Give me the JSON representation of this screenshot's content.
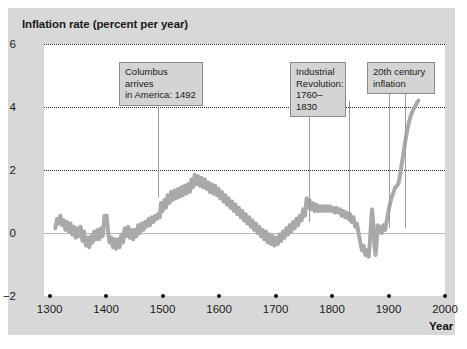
{
  "chart_data": {
    "type": "line",
    "title": "Inflation rate (percent per year)",
    "xlabel": "Year",
    "ylabel": "Inflation rate (percent per year)",
    "xlim": [
      1290,
      2000
    ],
    "ylim": [
      -2,
      6
    ],
    "xticks": [
      1300,
      1400,
      1500,
      1600,
      1700,
      1800,
      1900,
      2000
    ],
    "xtick_labels": [
      "1300",
      "1400",
      "1500",
      "1600",
      "1700",
      "1800",
      "1900",
      "2000"
    ],
    "yticks": [
      -2,
      0,
      2,
      4,
      6
    ],
    "ytick_labels": [
      "−2",
      "0",
      "2",
      "4",
      "6"
    ],
    "gridlines_y": [
      2,
      4,
      6
    ],
    "grid": "horizontal-dotted",
    "zero_line": 0,
    "legend": "none",
    "series": [
      {
        "name": "Inflation rate",
        "color": "#a9a9a9",
        "line_width": 4,
        "x_start": 1310,
        "x_end": 1955,
        "points": [
          [
            1310,
            0.15
          ],
          [
            1313,
            0.45
          ],
          [
            1316,
            0.3
          ],
          [
            1319,
            0.55
          ],
          [
            1322,
            0.25
          ],
          [
            1325,
            0.4
          ],
          [
            1328,
            0.1
          ],
          [
            1331,
            0.35
          ],
          [
            1334,
            0.05
          ],
          [
            1337,
            0.3
          ],
          [
            1340,
            -0.05
          ],
          [
            1343,
            0.2
          ],
          [
            1346,
            -0.15
          ],
          [
            1349,
            0.15
          ],
          [
            1352,
            -0.1
          ],
          [
            1355,
            0.2
          ],
          [
            1358,
            -0.25
          ],
          [
            1361,
            0.05
          ],
          [
            1364,
            -0.4
          ],
          [
            1367,
            -0.15
          ],
          [
            1370,
            -0.45
          ],
          [
            1373,
            -0.1
          ],
          [
            1376,
            -0.3
          ],
          [
            1379,
            0.05
          ],
          [
            1382,
            -0.2
          ],
          [
            1385,
            0.1
          ],
          [
            1388,
            -0.2
          ],
          [
            1391,
            0.15
          ],
          [
            1394,
            -0.1
          ],
          [
            1397,
            0.55
          ],
          [
            1399,
            0.3
          ],
          [
            1401,
            0.55
          ],
          [
            1403,
            0.1
          ],
          [
            1406,
            -0.3
          ],
          [
            1409,
            -0.15
          ],
          [
            1412,
            -0.45
          ],
          [
            1415,
            -0.2
          ],
          [
            1418,
            -0.5
          ],
          [
            1421,
            -0.2
          ],
          [
            1424,
            -0.45
          ],
          [
            1427,
            -0.05
          ],
          [
            1430,
            -0.3
          ],
          [
            1433,
            0.15
          ],
          [
            1436,
            -0.1
          ],
          [
            1439,
            0.2
          ],
          [
            1442,
            -0.15
          ],
          [
            1445,
            0.1
          ],
          [
            1448,
            -0.2
          ],
          [
            1451,
            0.1
          ],
          [
            1454,
            -0.1
          ],
          [
            1457,
            0.25
          ],
          [
            1460,
            0.0
          ],
          [
            1463,
            0.3
          ],
          [
            1466,
            0.1
          ],
          [
            1469,
            0.35
          ],
          [
            1472,
            0.2
          ],
          [
            1475,
            0.45
          ],
          [
            1478,
            0.25
          ],
          [
            1481,
            0.5
          ],
          [
            1484,
            0.35
          ],
          [
            1487,
            0.55
          ],
          [
            1490,
            0.45
          ],
          [
            1492,
            0.6
          ],
          [
            1495,
            0.5
          ],
          [
            1497,
            0.95
          ],
          [
            1500,
            0.7
          ],
          [
            1503,
            1.05
          ],
          [
            1506,
            0.8
          ],
          [
            1509,
            1.2
          ],
          [
            1512,
            0.95
          ],
          [
            1515,
            1.3
          ],
          [
            1518,
            1.05
          ],
          [
            1521,
            1.35
          ],
          [
            1524,
            1.1
          ],
          [
            1527,
            1.4
          ],
          [
            1530,
            1.15
          ],
          [
            1533,
            1.45
          ],
          [
            1536,
            1.2
          ],
          [
            1539,
            1.5
          ],
          [
            1542,
            1.25
          ],
          [
            1545,
            1.55
          ],
          [
            1548,
            1.3
          ],
          [
            1551,
            1.7
          ],
          [
            1554,
            1.45
          ],
          [
            1557,
            1.85
          ],
          [
            1560,
            1.55
          ],
          [
            1563,
            1.8
          ],
          [
            1566,
            1.5
          ],
          [
            1569,
            1.75
          ],
          [
            1572,
            1.45
          ],
          [
            1575,
            1.7
          ],
          [
            1578,
            1.4
          ],
          [
            1581,
            1.6
          ],
          [
            1584,
            1.3
          ],
          [
            1587,
            1.55
          ],
          [
            1590,
            1.25
          ],
          [
            1593,
            1.5
          ],
          [
            1596,
            1.2
          ],
          [
            1599,
            1.4
          ],
          [
            1602,
            1.1
          ],
          [
            1605,
            1.3
          ],
          [
            1608,
            1.0
          ],
          [
            1611,
            1.2
          ],
          [
            1614,
            0.9
          ],
          [
            1617,
            1.1
          ],
          [
            1620,
            0.8
          ],
          [
            1623,
            1.0
          ],
          [
            1626,
            0.7
          ],
          [
            1629,
            0.9
          ],
          [
            1632,
            0.6
          ],
          [
            1635,
            0.8
          ],
          [
            1638,
            0.5
          ],
          [
            1641,
            0.7
          ],
          [
            1644,
            0.4
          ],
          [
            1647,
            0.6
          ],
          [
            1650,
            0.3
          ],
          [
            1653,
            0.5
          ],
          [
            1656,
            0.2
          ],
          [
            1659,
            0.4
          ],
          [
            1662,
            0.1
          ],
          [
            1665,
            0.3
          ],
          [
            1668,
            0.0
          ],
          [
            1671,
            0.2
          ],
          [
            1674,
            -0.1
          ],
          [
            1677,
            0.1
          ],
          [
            1680,
            -0.2
          ],
          [
            1683,
            0.05
          ],
          [
            1686,
            -0.3
          ],
          [
            1689,
            -0.05
          ],
          [
            1692,
            -0.35
          ],
          [
            1695,
            -0.1
          ],
          [
            1698,
            -0.4
          ],
          [
            1701,
            -0.15
          ],
          [
            1704,
            -0.35
          ],
          [
            1707,
            -0.05
          ],
          [
            1710,
            -0.25
          ],
          [
            1713,
            0.05
          ],
          [
            1716,
            -0.15
          ],
          [
            1719,
            0.15
          ],
          [
            1722,
            -0.05
          ],
          [
            1725,
            0.25
          ],
          [
            1728,
            0.05
          ],
          [
            1731,
            0.35
          ],
          [
            1734,
            0.15
          ],
          [
            1737,
            0.45
          ],
          [
            1740,
            0.25
          ],
          [
            1743,
            0.55
          ],
          [
            1746,
            0.4
          ],
          [
            1749,
            0.75
          ],
          [
            1752,
            0.55
          ],
          [
            1755,
            1.1
          ],
          [
            1757,
            0.8
          ],
          [
            1760,
            1.05
          ],
          [
            1763,
            0.75
          ],
          [
            1766,
            0.95
          ],
          [
            1769,
            0.7
          ],
          [
            1772,
            0.9
          ],
          [
            1775,
            0.7
          ],
          [
            1778,
            0.85
          ],
          [
            1781,
            0.7
          ],
          [
            1784,
            0.85
          ],
          [
            1787,
            0.7
          ],
          [
            1790,
            0.85
          ],
          [
            1793,
            0.7
          ],
          [
            1796,
            0.85
          ],
          [
            1799,
            0.7
          ],
          [
            1802,
            0.8
          ],
          [
            1805,
            0.65
          ],
          [
            1808,
            0.8
          ],
          [
            1811,
            0.65
          ],
          [
            1814,
            0.75
          ],
          [
            1817,
            0.55
          ],
          [
            1820,
            0.7
          ],
          [
            1823,
            0.5
          ],
          [
            1826,
            0.65
          ],
          [
            1829,
            0.45
          ],
          [
            1832,
            0.6
          ],
          [
            1835,
            0.35
          ],
          [
            1838,
            0.5
          ],
          [
            1841,
            0.2
          ],
          [
            1844,
            0.3
          ],
          [
            1847,
            0.0
          ],
          [
            1850,
            -0.3
          ],
          [
            1853,
            -0.55
          ],
          [
            1856,
            -0.4
          ],
          [
            1859,
            -0.7
          ],
          [
            1862,
            -0.55
          ],
          [
            1865,
            -0.75
          ],
          [
            1867,
            -0.3
          ],
          [
            1869,
            0.3
          ],
          [
            1871,
            0.75
          ],
          [
            1873,
            0.3
          ],
          [
            1875,
            -0.35
          ],
          [
            1877,
            -0.7
          ],
          [
            1879,
            -0.3
          ],
          [
            1881,
            0.25
          ],
          [
            1883,
            0.05
          ],
          [
            1885,
            0.2
          ],
          [
            1888,
            0.0
          ],
          [
            1891,
            0.25
          ],
          [
            1894,
            0.1
          ],
          [
            1897,
            0.4
          ],
          [
            1900,
            0.7
          ],
          [
            1903,
            0.95
          ],
          [
            1906,
            1.15
          ],
          [
            1909,
            1.3
          ],
          [
            1912,
            1.45
          ],
          [
            1915,
            1.5
          ],
          [
            1918,
            1.6
          ],
          [
            1921,
            1.9
          ],
          [
            1924,
            2.25
          ],
          [
            1927,
            2.6
          ],
          [
            1930,
            2.95
          ],
          [
            1933,
            3.25
          ],
          [
            1936,
            3.5
          ],
          [
            1939,
            3.7
          ],
          [
            1942,
            3.85
          ],
          [
            1945,
            3.95
          ],
          [
            1948,
            4.05
          ],
          [
            1951,
            4.15
          ],
          [
            1953,
            4.2
          ]
        ]
      }
    ],
    "annotations": [
      {
        "id": "columbus",
        "text": "Columbus arrives\nin America: 1492",
        "box_left_px": 119,
        "box_top_px": 62,
        "box_width_px": 84,
        "leaders_x_years": [
          1492
        ],
        "leader_top_px": 89,
        "leader_bottom_px": 197
      },
      {
        "id": "industrial-revolution",
        "text": "Industrial\nRevolution:\n1760–1830",
        "box_left_px": 290,
        "box_top_px": 62,
        "box_width_px": 56,
        "leaders_x_years": [
          1760,
          1830
        ],
        "leader_top_px": 101,
        "leader_bottom_px": 222
      },
      {
        "id": "20th-century-inflation",
        "text": "20th century\ninflation",
        "box_left_px": 367,
        "box_top_px": 62,
        "box_width_px": 68,
        "leaders_x_years": [
          1900,
          1930
        ],
        "leader_top_px": 89,
        "leader_bottom_px": 228
      }
    ]
  },
  "axis": {
    "x_name": "Year"
  },
  "source": {
    "text": ""
  }
}
